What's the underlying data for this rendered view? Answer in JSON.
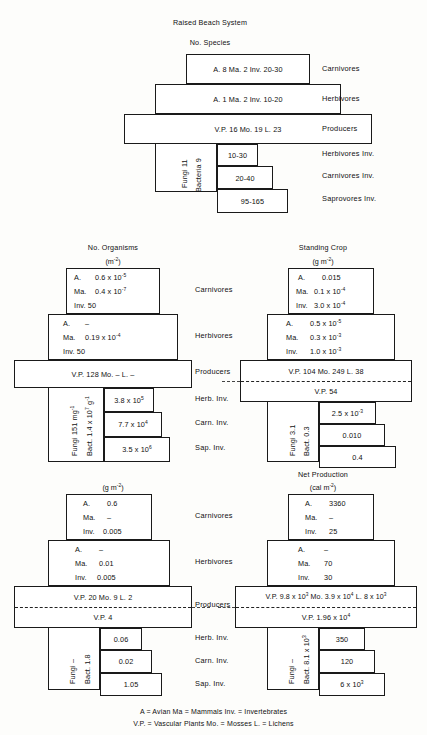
{
  "document": {
    "title": "Raised Beach System"
  },
  "legend": {
    "line1": "A = Avian    Ma = Mammals    Inv. = Invertebrates",
    "line2": "V.P. = Vascular Plants    Mo. = Mosses   L. = Lichens"
  },
  "row_labels": {
    "carnivores": "Carnivores",
    "herbivores": "Herbivores",
    "producers": "Producers",
    "herb_inv": "Herbivores Inv.",
    "carn_inv": "Carnivores Inv.",
    "sap_inv": "Saprovores Inv.",
    "herb_inv_short": "Herb. Inv.",
    "carn_inv_short": "Carn. Inv.",
    "sap_inv_short": "Sap. Inv."
  },
  "panels": {
    "species": {
      "title": "No. Species",
      "unit": "",
      "carnivores": "A. 8  Ma. 2  Inv. 20-30",
      "herbivores": "A. 1  Ma. 2  Inv. 10-20",
      "producers": "V.P. 16  Mo. 19  L. 23",
      "producers_second": "",
      "decomposer_a": "Fungi 11",
      "decomposer_b": "Bacteria 9",
      "herb_inv": "10-30",
      "carn_inv": "20-40",
      "sap_inv": "95-165"
    },
    "organisms": {
      "title": "No. Organisms",
      "unit": "(m-2)",
      "carn_a": "A.",
      "carn_a_v": "0.6 x 10-5",
      "carn_ma": "Ma.",
      "carn_ma_v": "0.4 x 10-7",
      "carn_inv_l": "Inv. 50",
      "herb_a": "A.",
      "herb_a_v": "–",
      "herb_ma": "Ma.",
      "herb_ma_v": "0.19 x 10-4",
      "herb_inv_l": "Inv. 50",
      "producers": "V.P. 128  Mo. –  L. –",
      "decomposer_a": "Fungi 151 mg-1",
      "decomposer_b": "Bact. 1.4 x 107 g-1",
      "herb_inv": "3.8 x 105",
      "carn_inv": "7.7 x 104",
      "sap_inv": "3.5 x 106"
    },
    "standing_crop": {
      "title": "Standing Crop",
      "unit": "(g m-2)",
      "carn_a": "A.",
      "carn_a_v": "0.015",
      "carn_ma": "Ma.",
      "carn_ma_v": "0.1 x 10-4",
      "carn_inv_l": "Inv.",
      "carn_inv_v": "3.0 x 10-4",
      "herb_a": "A.",
      "herb_a_v": "0.5 x 10-5",
      "herb_ma": "Ma.",
      "herb_ma_v": "0.3 x 10-3",
      "herb_inv_l": "Inv.",
      "herb_inv_v": "1.0 x 10-3",
      "producers": "V.P. 104  Mo. 249  L. 38",
      "producers_second": "V.P. 54",
      "decomposer_a": "Fungi 3.1",
      "decomposer_b": "Bact. 0.3",
      "herb_inv": "2.5 x 10-3",
      "carn_inv": "0.010",
      "sap_inv": "0.4"
    },
    "net_production_g": {
      "title": "",
      "unit": "(g m-2)",
      "carn_a": "A.",
      "carn_a_v": "0.6",
      "carn_ma": "Ma.",
      "carn_ma_v": "–",
      "carn_inv_l": "Inv.",
      "carn_inv_v": "0.005",
      "herb_a": "A.",
      "herb_a_v": "–",
      "herb_ma": "Ma.",
      "herb_ma_v": "0.01",
      "herb_inv_l": "Inv.",
      "herb_inv_v": "0.005",
      "producers": "V.P. 20  Mo. 9  L. 2",
      "producers_second": "V.P. 4",
      "decomposer_a": "Fungi –",
      "decomposer_b": "Bact. 1.8",
      "herb_inv": "0.06",
      "carn_inv": "0.02",
      "sap_inv": "1.05"
    },
    "net_production_cal": {
      "title": "Net Production",
      "unit": "(cal m-2)",
      "carn_a": "A.",
      "carn_a_v": "3360",
      "carn_ma": "Ma.",
      "carn_ma_v": "–",
      "carn_inv_l": "Inv.",
      "carn_inv_v": "25",
      "herb_a": "A.",
      "herb_a_v": "–",
      "herb_ma": "Ma.",
      "herb_ma_v": "70",
      "herb_inv_l": "Inv.",
      "herb_inv_v": "30",
      "producers": "V.P. 9.8 x 103  Mo. 3.9 x 104  L. 8 x 103",
      "producers_second": "V.P. 1.96 x 104",
      "decomposer_a": "Fungi –",
      "decomposer_b": "Bact. 8.1 x 103",
      "herb_inv": "350",
      "carn_inv": "120",
      "sap_inv": "6 x 103"
    }
  }
}
